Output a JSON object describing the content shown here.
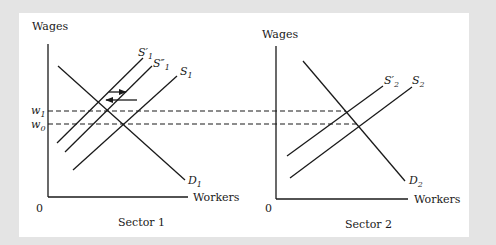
{
  "figure": {
    "background_color": "#e4e4e4",
    "panel_color": "#ffffff",
    "line_color": "#1a1a1a"
  },
  "sector1": {
    "title": "Sector 1",
    "y_axis_label": "Wages",
    "x_axis_label": "Workers",
    "origin_label": "0",
    "wage_labels": {
      "w1": {
        "base": "w",
        "sub": "1"
      },
      "w0": {
        "base": "w",
        "sub": "0"
      }
    },
    "curves": {
      "demand": {
        "base": "D",
        "sub": "1"
      },
      "supply": {
        "base": "S",
        "sub": "1"
      },
      "supply_prime": {
        "base": "S′",
        "sub": "1"
      },
      "supply_double_prime": {
        "base": "S″",
        "sub": "1"
      }
    },
    "arrows": [
      {
        "name": "shift-right-arrow",
        "direction": "right"
      },
      {
        "name": "shift-left-arrow",
        "direction": "left"
      }
    ]
  },
  "sector2": {
    "title": "Sector 2",
    "y_axis_label": "Wages",
    "x_axis_label": "Workers",
    "origin_label": "0",
    "curves": {
      "demand": {
        "base": "D",
        "sub": "2"
      },
      "supply": {
        "base": "S",
        "sub": "2"
      },
      "supply_prime": {
        "base": "S′",
        "sub": "2"
      }
    }
  }
}
